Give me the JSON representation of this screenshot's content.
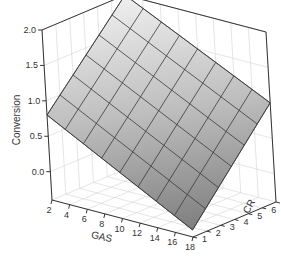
{
  "chart_data": {
    "type": "surface3d",
    "title": "",
    "xlabel": "GAS",
    "ylabel": "CR",
    "zlabel": "Conversion",
    "x_ticks": [
      2,
      4,
      6,
      8,
      10,
      12,
      14,
      16,
      18
    ],
    "y_ticks": [
      1,
      2,
      3,
      4,
      5,
      6,
      7
    ],
    "z_ticks": [
      "0.0",
      "0.5",
      "1.0",
      "1.5",
      "2.0"
    ],
    "xlim": [
      2,
      18
    ],
    "ylim": [
      1,
      7
    ],
    "zlim": [
      -0.4,
      2.0
    ],
    "grid": true,
    "surface": {
      "x": [
        2,
        4,
        6,
        8,
        10,
        12,
        14,
        16,
        18
      ],
      "y": [
        1,
        2,
        3,
        4,
        5,
        6,
        7
      ],
      "corners": {
        "gas2_cr1": 0.8,
        "gas2_cr7": 2.0,
        "gas18_cr1": -0.3,
        "gas18_cr7": 1.0
      },
      "description": "Approximately planar response surface: conversion increases with CR and decreases with GAS"
    }
  },
  "labels": {
    "xlabel": "GAS",
    "ylabel": "CR",
    "zlabel": "Conversion"
  },
  "colors": {
    "surface_light": "#e6e6e6",
    "surface_dark": "#8c8c8c",
    "mesh": "#3a3a3a",
    "grid": "#d4d4d4",
    "axis": "#333333"
  }
}
